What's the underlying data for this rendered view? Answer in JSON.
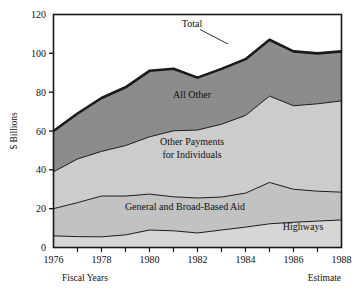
{
  "chart_data": {
    "type": "area",
    "title": "",
    "subtitle": "",
    "xlabel": "Fiscal Years",
    "ylabel": "$ Billions",
    "xlim": [
      1976,
      1988
    ],
    "ylim": [
      0,
      120
    ],
    "grid": false,
    "legend_position": "inline-annotations",
    "stacked": true,
    "x": [
      1976,
      1977,
      1978,
      1979,
      1980,
      1981,
      1982,
      1983,
      1984,
      1985,
      1986,
      1987,
      1988
    ],
    "x_ticks": [
      1976,
      1977,
      1978,
      1979,
      1980,
      1981,
      1982,
      1983,
      1984,
      1985,
      1986,
      1987,
      1988
    ],
    "x_tick_labels": [
      "1976",
      "",
      "1978",
      "",
      "1980",
      "",
      "1982",
      "",
      "1984",
      "",
      "1986",
      "",
      "1988"
    ],
    "y_ticks": [
      0,
      20,
      40,
      60,
      80,
      100,
      120
    ],
    "y_tick_labels": [
      "0",
      "20",
      "40",
      "60",
      "80",
      "100",
      "120"
    ],
    "series": [
      {
        "name": "Highways",
        "label": "Highways",
        "color": "#d6d6d6",
        "values": [
          6.0,
          5.6,
          5.5,
          6.5,
          9.0,
          8.6,
          7.5,
          9.0,
          10.5,
          12.2,
          13.0,
          13.6,
          14.2
        ]
      },
      {
        "name": "General and Broad-Based Aid",
        "label": "General and Broad-Based Aid",
        "color": "#c2c2c2",
        "values": [
          14.0,
          17.5,
          21.0,
          20.0,
          18.5,
          17.5,
          18.0,
          17.0,
          17.5,
          21.3,
          17.0,
          15.4,
          14.3
        ]
      },
      {
        "name": "Other Payments for Individuals",
        "label": "Other Payments for Individuals",
        "color": "#cccccc",
        "values": [
          19.0,
          22.5,
          23.0,
          26.0,
          29.5,
          34.0,
          35.0,
          37.5,
          40.0,
          44.5,
          43.0,
          45.0,
          47.0
        ]
      },
      {
        "name": "All Other",
        "label": "All Other",
        "color": "#8c8c8c",
        "values": [
          21.0,
          23.4,
          27.5,
          30.0,
          34.0,
          32.0,
          27.0,
          28.5,
          29.0,
          29.0,
          28.0,
          26.0,
          25.5
        ]
      }
    ],
    "cumulative_totals": [
      60.0,
      69.0,
      77.0,
      82.5,
      91.0,
      92.1,
      87.5,
      92.0,
      97.0,
      107.0,
      101.0,
      100.0,
      101.0
    ],
    "annotations": [
      {
        "text": "Total",
        "type": "leader-label"
      },
      {
        "text": "All Other",
        "type": "band-label"
      },
      {
        "text": "Other Payments",
        "type": "band-label"
      },
      {
        "text": "for Individuals",
        "type": "band-label"
      },
      {
        "text": "General and Broad-Based Aid",
        "type": "band-label"
      },
      {
        "text": "Highways",
        "type": "band-label"
      }
    ]
  },
  "axes": {
    "y_axis_title": "$ Billions",
    "y_labels": [
      "120",
      "100",
      "80",
      "60",
      "40",
      "20",
      "0"
    ],
    "x_labels": [
      "1976",
      "1978",
      "1980",
      "1982",
      "1984",
      "1986",
      "1988"
    ]
  },
  "footer": {
    "left_note": "Fiscal Years",
    "right_note": "Estimate"
  },
  "labels": {
    "total": "Total",
    "all_other": "All Other",
    "other_payments_line1": "Other Payments",
    "other_payments_line2": "for Individuals",
    "general_aid": "General and Broad-Based Aid",
    "highways": "Highways"
  },
  "colors": {
    "band_all_other": "#8c8c8c",
    "band_other_payments": "#cccccc",
    "band_general_aid": "#c2c2c2",
    "band_highways": "#d6d6d6",
    "outline": "#1a1a1a",
    "background": "#ffffff"
  }
}
